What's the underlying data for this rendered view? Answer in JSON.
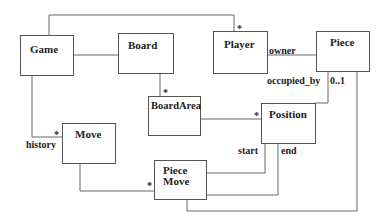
{
  "diagram": {
    "type": "UML class diagram",
    "classes": [
      {
        "id": "game",
        "name": "Game"
      },
      {
        "id": "board",
        "name": "Board"
      },
      {
        "id": "player",
        "name": "Player"
      },
      {
        "id": "piece",
        "name": "Piece"
      },
      {
        "id": "boardarea",
        "name": "BoardArea"
      },
      {
        "id": "position",
        "name": "Position"
      },
      {
        "id": "move",
        "name": "Move"
      },
      {
        "id": "piecemove",
        "name_line1": "Piece",
        "name_line2": "Move"
      }
    ],
    "labels": {
      "game_player_mult": "*",
      "board_boardarea_mult": "*",
      "player_owner": "owner",
      "piece_occupied_by": "occupied_by",
      "piece_position_mult": "0..1",
      "boardarea_position_mult": "*",
      "game_move_mult": "*",
      "game_move_role": "history",
      "move_piecemove_mult": "*",
      "position_start": "start",
      "position_end": "end"
    },
    "associations": [
      {
        "from": "Game",
        "to": "Player",
        "mult": "*"
      },
      {
        "from": "Game",
        "to": "Board"
      },
      {
        "from": "Board",
        "to": "BoardArea",
        "mult": "*"
      },
      {
        "from": "Player",
        "to": "Piece",
        "role": "owner"
      },
      {
        "from": "Piece",
        "to": "Position",
        "role": "occupied_by",
        "mult": "0..1"
      },
      {
        "from": "BoardArea",
        "to": "Position",
        "mult": "*"
      },
      {
        "from": "Game",
        "to": "Move",
        "role": "history",
        "mult": "*"
      },
      {
        "from": "Move",
        "to": "PieceMove",
        "mult": "*"
      },
      {
        "from": "PieceMove",
        "to": "Position",
        "role": "start"
      },
      {
        "from": "PieceMove",
        "to": "Position",
        "role": "end"
      },
      {
        "from": "PieceMove",
        "to": "Piece"
      }
    ]
  }
}
